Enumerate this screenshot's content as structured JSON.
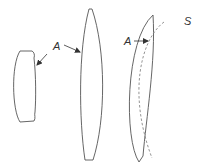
{
  "diagram": {
    "labels": {
      "a_left": "A",
      "a_right": "A",
      "s": "S"
    },
    "elements": [
      {
        "name": "small-lens",
        "description": "thick small lens element"
      },
      {
        "name": "biconvex-lens",
        "description": "tall biconvex lens"
      },
      {
        "name": "meniscus-lens",
        "description": "plano/meniscus lens with aspheric surface A"
      },
      {
        "name": "reference-sphere",
        "description": "dashed reference sphere S"
      }
    ],
    "colors": {
      "stroke": "#555555",
      "arrow": "#333333",
      "dashed": "#777777"
    }
  }
}
